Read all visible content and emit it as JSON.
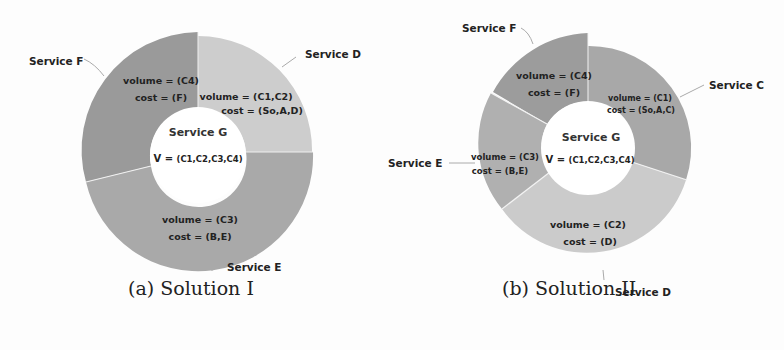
{
  "figure": {
    "panels": [
      {
        "id": "a",
        "caption": "(a) Solution I",
        "center": {
          "title": "Service G",
          "v_prefix": "V = ",
          "v_value": "(C1,C2,C3,C4)"
        },
        "segments": [
          {
            "service": "Service D",
            "volume": "volume = (C1,C2)",
            "cost": "cost = (So,A,D)",
            "color": "#cdcdcd"
          },
          {
            "service": "Service E",
            "volume": "volume = (C3)",
            "cost": "cost = (B,E)",
            "color": "#a9a9a9"
          },
          {
            "service": "Service F",
            "volume": "volume = (C4)",
            "cost": "cost = (F)",
            "color": "#9a9a9a"
          }
        ]
      },
      {
        "id": "b",
        "caption": "(b) Solution II",
        "center": {
          "title": "Service G",
          "v_prefix": "V = ",
          "v_value": "(C1,C2,C3,C4)"
        },
        "segments": [
          {
            "service": "Service C",
            "volume": "volume = (C1)",
            "cost": "cost = (So,A,C)",
            "color": "#a8a8a8"
          },
          {
            "service": "Service D",
            "volume": "volume = (C2)",
            "cost": "cost = (D)",
            "color": "#cbcbcb"
          },
          {
            "service": "Service E",
            "volume": "volume = (C3)",
            "cost": "cost = (B,E)",
            "color": "#b0b0b0"
          },
          {
            "service": "Service F",
            "volume": "volume = (C4)",
            "cost": "cost = (F)",
            "color": "#9c9c9c"
          }
        ]
      }
    ]
  }
}
